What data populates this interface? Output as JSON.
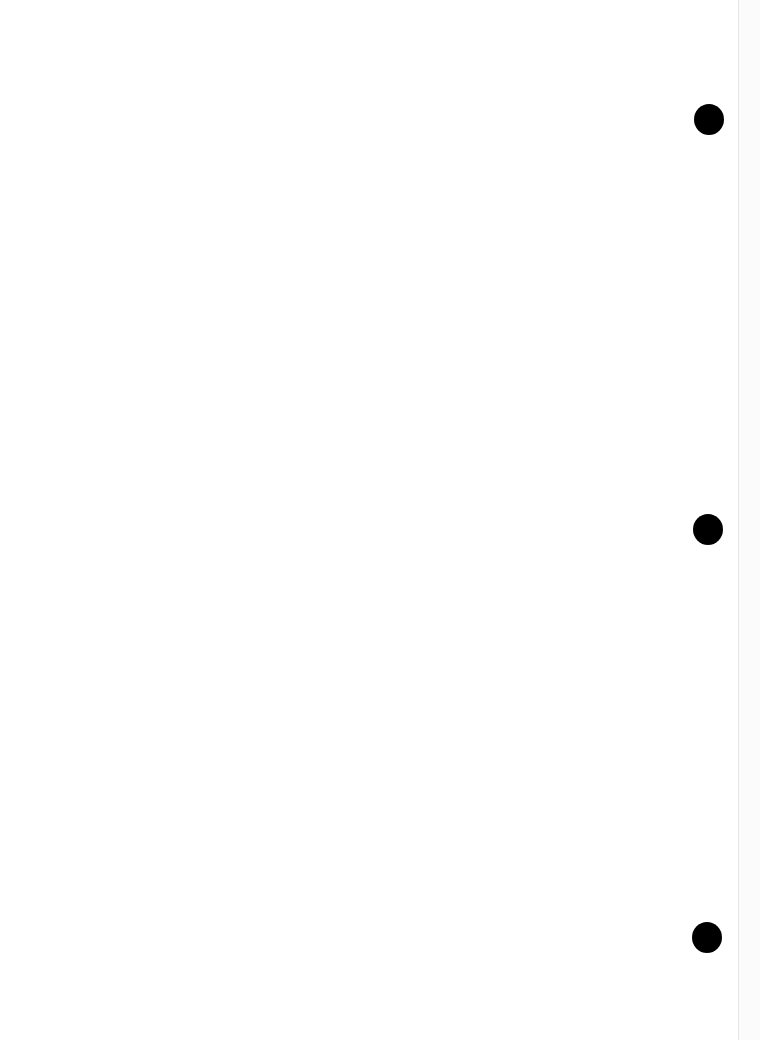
{
  "page": {
    "description": "Blank scanned page with three hole punches",
    "background_color": "#ffffff",
    "edge_strip_color": "#fbfbfb",
    "hole_color": "#000000",
    "holes": [
      {
        "label": "punch-hole-top"
      },
      {
        "label": "punch-hole-middle"
      },
      {
        "label": "punch-hole-bottom"
      }
    ]
  }
}
